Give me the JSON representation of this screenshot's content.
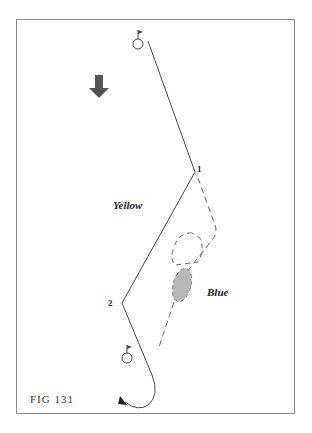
{
  "figure": {
    "caption": "FIG 131",
    "labels": {
      "yellow": "Yellow",
      "blue": "Blue",
      "point1": "1",
      "point2": "2"
    },
    "icons": [
      "flag-hole-icon",
      "direction-arrow-icon",
      "flag-hole-icon"
    ],
    "colors": {
      "line": "#444444",
      "dashed": "#666666",
      "arrow": "#555555",
      "shaded": "#b0b0b0",
      "frame": "#8a8a8a"
    }
  }
}
